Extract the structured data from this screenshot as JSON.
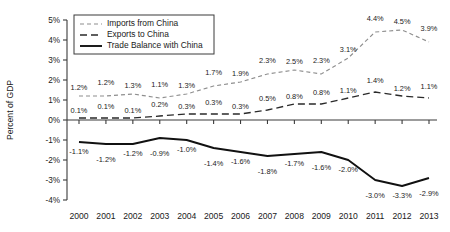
{
  "chart_data": {
    "type": "line",
    "title": "",
    "xlabel": "",
    "ylabel": "Percent of GDP",
    "categories": [
      "2000",
      "2001",
      "2002",
      "2003",
      "2004",
      "2005",
      "2006",
      "2007",
      "2008",
      "2009",
      "2010",
      "2011",
      "2012",
      "2013"
    ],
    "ylim": [
      -4,
      5
    ],
    "ytick_labels": [
      "5%",
      "4%",
      "3%",
      "2%",
      "1%",
      "0%",
      "-1%",
      "-2%",
      "-3%",
      "-4%"
    ],
    "ytick_values": [
      5,
      4,
      3,
      2,
      1,
      0,
      -1,
      -2,
      -3,
      -4
    ],
    "grid": false,
    "legend_position": "top-left-inside",
    "series": [
      {
        "name": "Imports from China",
        "style": "dotted",
        "color": "#8e8e8e",
        "values": [
          1.2,
          1.2,
          1.3,
          1.1,
          1.3,
          1.7,
          1.9,
          2.3,
          2.5,
          2.3,
          3.1,
          4.4,
          4.5,
          3.9
        ],
        "labels": [
          "1.2%",
          "1.2%",
          "1.3%",
          "1.1%",
          "1.3%",
          "1.7%",
          "1.9%",
          "2.3%",
          "2.5%",
          "2.3%",
          "3.1%",
          "4.4%",
          "4.5%",
          "3.9%"
        ]
      },
      {
        "name": "Exports to China",
        "style": "dashed",
        "color": "#2a2a2a",
        "values": [
          0.1,
          0.1,
          0.1,
          0.2,
          0.3,
          0.3,
          0.3,
          0.5,
          0.8,
          0.8,
          1.1,
          1.4,
          1.2,
          1.1
        ],
        "labels": [
          "0.1%",
          "0.1%",
          "0.1%",
          "0.2%",
          "0.3%",
          "0.3%",
          "0.3%",
          "0.5%",
          "0.8%",
          "0.8%",
          "1.1%",
          "1.4%",
          "1.2%",
          "1.1%"
        ]
      },
      {
        "name": "Trade Balance with China",
        "style": "solid",
        "color": "#111111",
        "values": [
          -1.1,
          -1.2,
          -1.2,
          -0.9,
          -1.0,
          -1.4,
          -1.6,
          -1.8,
          -1.7,
          -1.6,
          -2.0,
          -3.0,
          -3.3,
          -2.9
        ],
        "labels": [
          "-1.1%",
          "-1.2%",
          "-1.2%",
          "-0.9%",
          "-1.0%",
          "-1.4%",
          "-1.6%",
          "-1.8%",
          "-1.7%",
          "-1.6%",
          "-2.0%",
          "-3.0%",
          "-3.3%",
          "-2.9%"
        ]
      }
    ]
  }
}
